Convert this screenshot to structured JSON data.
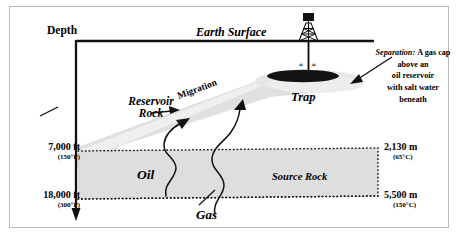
{
  "figure": {
    "axis": {
      "depth_label": "Depth",
      "surface_label": "Earth Surface"
    },
    "units_left": [
      {
        "depth": "7,000 ft",
        "temperature": "(150°F)"
      },
      {
        "depth": "18,000 ft",
        "temperature": "(300°F)"
      }
    ],
    "units_right": [
      {
        "depth": "2,130 m",
        "temperature": "(65°C)"
      },
      {
        "depth": "5,500 m",
        "temperature": "(150°C)"
      }
    ],
    "labels": {
      "reservoir_rock": "Reservoir\nRock",
      "migration": "Migration",
      "trap": "Trap",
      "oil": "Oil",
      "gas": "Gas",
      "source_rock": "Source Rock"
    },
    "annotation": {
      "heading": "Separation:",
      "body": "A gas cap\nabove an\noil reservoir\nwith salt water\nbeneath"
    },
    "caption": "",
    "colors": {
      "reservoir_fill": "#dcdcdc",
      "source_rock_fill": "#dcdcdc",
      "gas_cap": "#151515",
      "ink": "#111111",
      "frame": "#b9b9b9"
    }
  }
}
